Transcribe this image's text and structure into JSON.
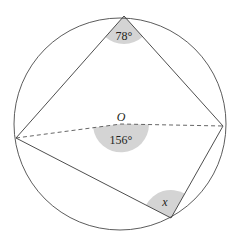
{
  "diagram": {
    "type": "circle-geometry",
    "circle": {
      "center_label": "O"
    },
    "angles": {
      "top": {
        "label": "78°",
        "value": 78
      },
      "center": {
        "label": "156°",
        "value": 156
      },
      "bottom": {
        "label": "x"
      }
    },
    "colors": {
      "stroke": "#3a3a3a",
      "fill_sector": "#d4d4d4",
      "background": "#ffffff"
    }
  }
}
